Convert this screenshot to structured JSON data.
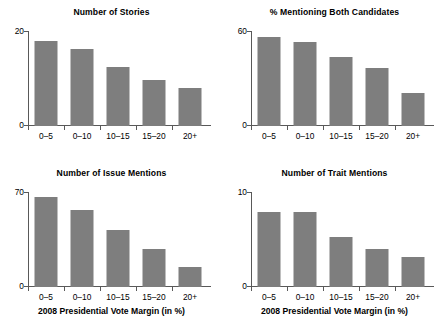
{
  "figure": {
    "bar_color": "#7e7e7e",
    "axis_color": "#595959",
    "background": "#ffffff",
    "shared_xlabel": "2008 Presidential Vote Margin (in %)",
    "categories": [
      "0–5",
      "0–10",
      "10–15",
      "15–20",
      "20+"
    ]
  },
  "chart_data": [
    {
      "type": "bar",
      "panel": "top-left",
      "title": "Number of Stories",
      "categories": [
        "0–5",
        "0–10",
        "10–15",
        "15–20",
        "20+"
      ],
      "values": [
        18.0,
        16.2,
        12.4,
        9.7,
        8.0
      ],
      "xlabel": "",
      "ylabel": "",
      "ylim": [
        0,
        20
      ],
      "yticks": [
        0,
        20
      ],
      "ytick_labels": [
        "0",
        "20"
      ],
      "grid": false,
      "legend": "none"
    },
    {
      "type": "bar",
      "panel": "top-right",
      "title": "% Mentioning Both Candidates",
      "categories": [
        "0–5",
        "0–10",
        "10–15",
        "15–20",
        "20+"
      ],
      "values": [
        56.0,
        53.0,
        43.5,
        36.5,
        21.0
      ],
      "xlabel": "",
      "ylabel": "",
      "ylim": [
        0,
        60
      ],
      "yticks": [
        0,
        60
      ],
      "ytick_labels": [
        "0",
        "60"
      ],
      "grid": false,
      "legend": "none"
    },
    {
      "type": "bar",
      "panel": "bottom-left",
      "title": "Number of Issue Mentions",
      "categories": [
        "0–5",
        "0–10",
        "10–15",
        "15–20",
        "20+"
      ],
      "values": [
        66.0,
        56.5,
        42.0,
        28.0,
        14.5
      ],
      "xlabel": "2008 Presidential Vote Margin (in %)",
      "ylabel": "",
      "ylim": [
        0,
        70
      ],
      "yticks": [
        0,
        70
      ],
      "ytick_labels": [
        "0",
        "70"
      ],
      "grid": false,
      "legend": "none"
    },
    {
      "type": "bar",
      "panel": "bottom-right",
      "title": "Number of Trait Mentions",
      "categories": [
        "0–5",
        "0–10",
        "10–15",
        "15–20",
        "20+"
      ],
      "values": [
        7.9,
        7.9,
        5.3,
        4.0,
        3.2
      ],
      "xlabel": "2008 Presidential Vote Margin (in %)",
      "ylabel": "",
      "ylim": [
        0,
        10
      ],
      "yticks": [
        0,
        10
      ],
      "ytick_labels": [
        "0",
        "10"
      ],
      "grid": false,
      "legend": "none"
    }
  ]
}
